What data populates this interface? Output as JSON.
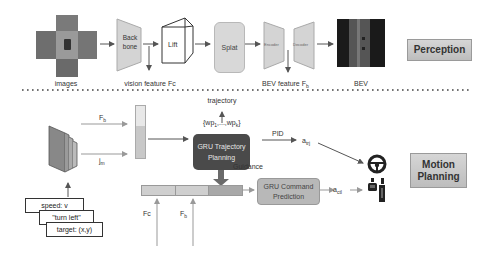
{
  "perception": {
    "stage_label": "Perception",
    "images_label": "images",
    "backbone_label": [
      "Back",
      "bone"
    ],
    "vision_feature_label": "vision feature Fc",
    "lift_label": "Lift",
    "splat_label": "Splat",
    "encoder_label": "Encoder",
    "decoder_label": "Decoder",
    "bev_feature_label": "BEV feature F",
    "bev_feature_sub": "b",
    "bev_label": "BEV"
  },
  "motion_planning": {
    "stage_label": [
      "Motion",
      "Planning"
    ],
    "fb_label": "F",
    "fb_sub": "b",
    "jm_label": "j",
    "jm_sub": "m",
    "trajectory_label": "trajectory",
    "waypoints_label": "{wp",
    "waypoints_sub1": "1",
    "waypoints_mid": ",...,wp",
    "waypoints_sub2": "k",
    "waypoints_end": "}",
    "gru_traj_label": [
      "GRU Trajectory",
      "Planning"
    ],
    "pid_label": "PID",
    "a_traj": "a",
    "a_traj_sub": "trj",
    "guidance_label": "Guidance",
    "gru_cmd_label": [
      "GRU Command",
      "Prediction"
    ],
    "a_ctl": "a",
    "a_ctl_sub": "ctl",
    "fc_label": "Fc",
    "fb2_label": "F",
    "fb2_sub": "b",
    "inputs": [
      "speed:  v",
      "\"turn left\"",
      "target:  (x,y)"
    ]
  },
  "colors": {
    "stage_box": "#c8c8c8",
    "gru_traj": "#4a4a4a",
    "gru_cmd": "#b8b8b8",
    "arrow": "#555555"
  }
}
